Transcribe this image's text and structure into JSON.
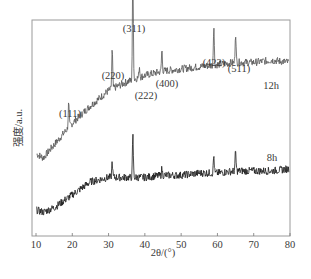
{
  "chart_data": {
    "type": "line",
    "title": "",
    "xlabel": "2θ/(°)",
    "ylabel": "强度/a.u.",
    "xlim": [
      10,
      80
    ],
    "x_ticks": [
      10,
      20,
      30,
      40,
      50,
      60,
      70,
      80
    ],
    "y_ticks": [],
    "grid": false,
    "legend": "none (series labeled inline)",
    "series": [
      {
        "name": "12h",
        "color": "#555555",
        "baseline": [
          [
            10,
            0.38
          ],
          [
            12,
            0.36
          ],
          [
            15,
            0.42
          ],
          [
            20,
            0.52
          ],
          [
            25,
            0.6
          ],
          [
            30,
            0.67
          ],
          [
            35,
            0.71
          ],
          [
            40,
            0.74
          ],
          [
            45,
            0.76
          ],
          [
            50,
            0.77
          ],
          [
            55,
            0.78
          ],
          [
            60,
            0.79
          ],
          [
            65,
            0.8
          ],
          [
            70,
            0.8
          ],
          [
            75,
            0.81
          ],
          [
            80,
            0.8
          ]
        ],
        "peaks": [
          {
            "two_theta": 19.0,
            "height": 0.11,
            "label": "(111)"
          },
          {
            "two_theta": 31.0,
            "height": 0.18,
            "label": "(220)"
          },
          {
            "two_theta": 36.7,
            "height": 0.5,
            "label": "(311)"
          },
          {
            "two_theta": 38.5,
            "height": 0.05,
            "label": "(222)"
          },
          {
            "two_theta": 44.7,
            "height": 0.1,
            "label": "(400)"
          },
          {
            "two_theta": 59.0,
            "height": 0.18,
            "label": "(422)"
          },
          {
            "two_theta": 65.0,
            "height": 0.14,
            "label": "(511)"
          }
        ]
      },
      {
        "name": "8h",
        "color": "#1a1a1a",
        "baseline": [
          [
            10,
            0.12
          ],
          [
            12,
            0.11
          ],
          [
            15,
            0.13
          ],
          [
            20,
            0.19
          ],
          [
            25,
            0.25
          ],
          [
            30,
            0.27
          ],
          [
            35,
            0.27
          ],
          [
            40,
            0.27
          ],
          [
            45,
            0.28
          ],
          [
            50,
            0.28
          ],
          [
            55,
            0.29
          ],
          [
            60,
            0.29
          ],
          [
            65,
            0.3
          ],
          [
            70,
            0.3
          ],
          [
            75,
            0.3
          ],
          [
            80,
            0.31
          ]
        ],
        "peaks": [
          {
            "two_theta": 31.0,
            "height": 0.07
          },
          {
            "two_theta": 36.7,
            "height": 0.19
          },
          {
            "two_theta": 44.7,
            "height": 0.03
          },
          {
            "two_theta": 59.0,
            "height": 0.08
          },
          {
            "two_theta": 65.0,
            "height": 0.09
          }
        ]
      }
    ],
    "annotations": [
      "(111)",
      "(220)",
      "(311)",
      "(222)",
      "(400)",
      "(422)",
      "(511)",
      "12h",
      "8h"
    ]
  },
  "layout": {
    "plot": {
      "left": 32,
      "right": 290,
      "top": 20,
      "bottom": 236
    },
    "x_pixel": {
      "10": 36,
      "80": 290
    },
    "y_pixel_unit": 217
  },
  "labels": {
    "peak_label_positions": {
      "(111)": [
        70,
        117
      ],
      "(220)": [
        113,
        79
      ],
      "(311)": [
        134,
        32
      ],
      "(222)": [
        146,
        99
      ],
      "(400)": [
        167,
        87
      ],
      "(422)": [
        214,
        66
      ],
      "(511)": [
        239,
        72
      ]
    },
    "series_label_positions": {
      "12h": [
        271,
        89
      ],
      "8h": [
        272,
        161
      ]
    }
  }
}
